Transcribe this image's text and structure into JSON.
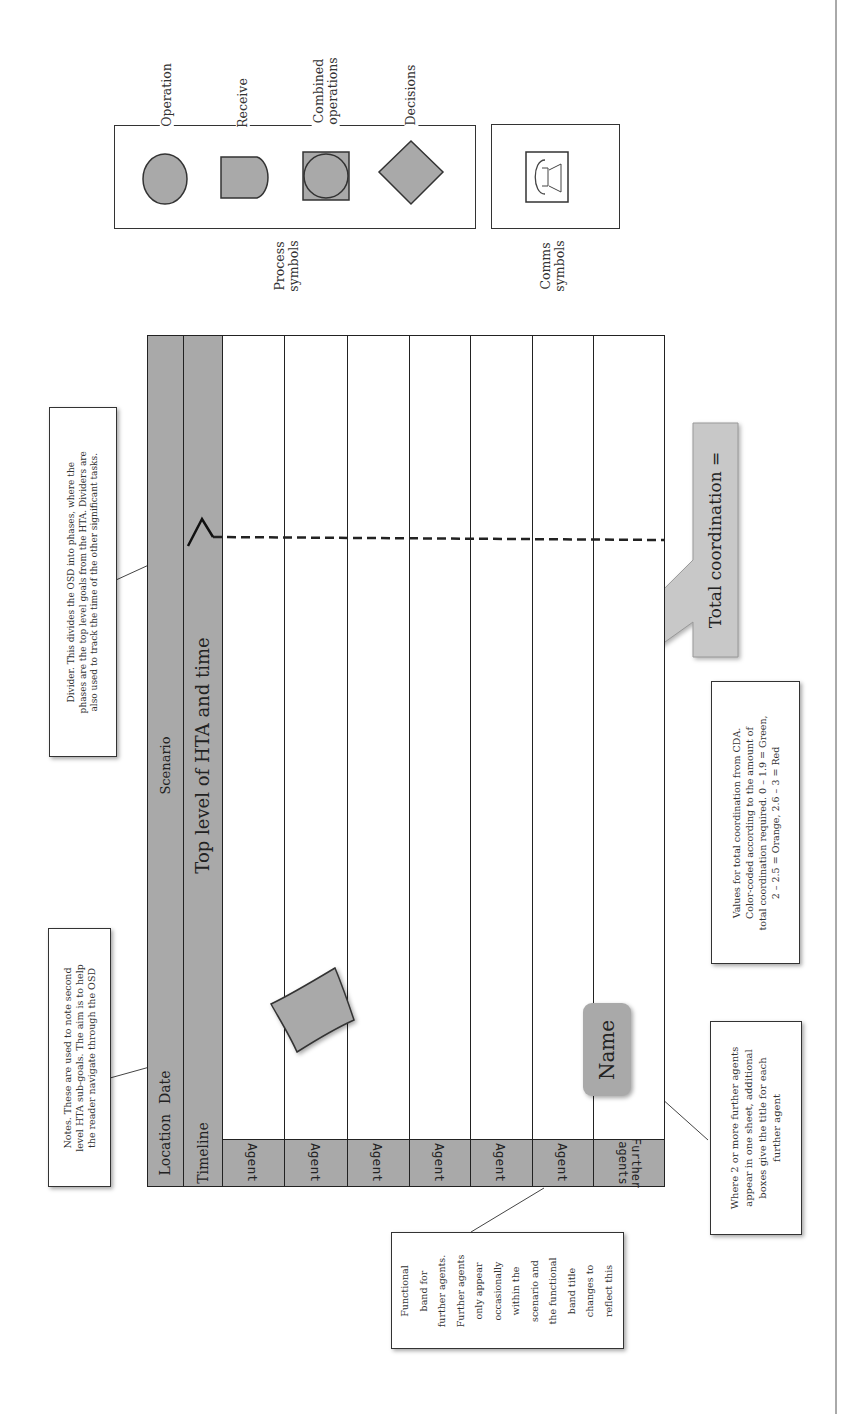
{
  "legend": {
    "process": {
      "caption": "Process\nsymbols",
      "items": [
        {
          "label": "Operation",
          "icon": "circle-icon"
        },
        {
          "label": "Receive",
          "icon": "d-shape-icon"
        },
        {
          "label": "Combined\noperations",
          "icon": "circle-in-square-icon"
        },
        {
          "label": "Decisions",
          "icon": "diamond-icon"
        }
      ]
    },
    "comms": {
      "caption": "Comms\nsymbols",
      "items": [
        {
          "label": "",
          "icon": "telephone-icon"
        }
      ]
    }
  },
  "osd_table": {
    "header": {
      "location": "Location",
      "date": "Date",
      "scenario": "Scenario",
      "timeline": "Timeline",
      "top_level": "Top level of HTA and time"
    },
    "agents": [
      "Agent",
      "Agent",
      "Agent",
      "Agent",
      "Agent",
      "Agent",
      "Further\nagents"
    ],
    "name_box": "Name",
    "total_coordination": "Total coordination ="
  },
  "callouts": {
    "divider": "Divider. This divides the OSD into phases, where the\nphases are the top level goals from the HTA. Dividers are\nalso used to track the time of the other significant tasks.",
    "notes": "Notes. These are used to note second\nlevel HTA sub-goals. The aim is to help\nthe reader navigate through the OSD",
    "values": "Values for total coordination from CDA.\nColor-coded according to the amount of\ntotal coordination required. 0 – 1.9 = Green,\n2 – 2.5 = Orange, 2.6 – 3 = Red",
    "further_agents": "Where 2 or more further agents\nappear in one sheet, additional\nboxes give the title for each\nfurther agent",
    "functional_band": "Functional\nband for\nfurther agents.\nFurther agents\nonly appear\noccasionally\nwithin the\nscenario and\nthe functional\nband title\nchanges to\nreflect this"
  },
  "colors": {
    "band_grey": "#a9a9a9",
    "callout_grey": "#c8c8c8",
    "line": "#222222"
  }
}
